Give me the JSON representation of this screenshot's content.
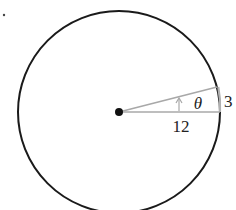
{
  "diagram": {
    "type": "circle-sector",
    "labels": {
      "radius": "12",
      "arc": "3",
      "angle": "θ"
    },
    "colors": {
      "circle": "#1a1a1a",
      "radius_lines": "#a8a8a8",
      "center_dot": "#111111",
      "background": "#ffffff"
    },
    "geometry": {
      "center": [
        119,
        112
      ],
      "radius_px": 101
    }
  }
}
